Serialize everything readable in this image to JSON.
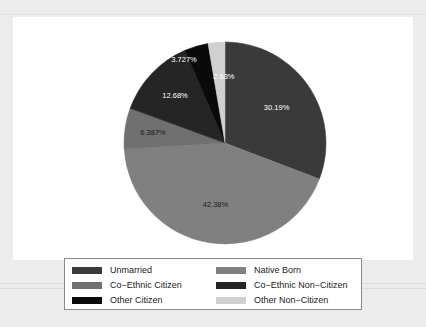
{
  "chart_data": {
    "type": "pie",
    "title": "",
    "subtitle": "",
    "xlabel": "",
    "ylabel": "",
    "legend_position": "bottom",
    "grid": false,
    "start_angle_deg": 0,
    "direction": "clockwise",
    "categories": [
      "Unmarried",
      "Native Born",
      "Co-Ethnic Citizen",
      "Co-Ethnic Non-Citizen",
      "Other Citizen",
      "Other Non-Citizen"
    ],
    "values": [
      30.19,
      42.38,
      6.387,
      12.68,
      3.727,
      2.63
    ],
    "value_labels": [
      "30.19%",
      "42.38%",
      "6.387%",
      "12.68%",
      "3.727%",
      "2.63%"
    ],
    "colors": [
      "#3a3a3a",
      "#808080",
      "#707070",
      "#252525",
      "#0a0a0a",
      "#d0d0d0"
    ],
    "label_text_colors": [
      "#ffffff",
      "#1a1a1a",
      "#1a1a1a",
      "#ffffff",
      "#ffffff",
      "#ffffff"
    ],
    "slices": [
      {
        "label": "Unmarried",
        "value": 30.19,
        "display": "30.19%",
        "color": "#3a3a3a"
      },
      {
        "label": "Native Born",
        "value": 42.38,
        "display": "42.38%",
        "color": "#808080"
      },
      {
        "label": "Co-Ethnic Citizen",
        "value": 6.387,
        "display": "6.387%",
        "color": "#707070"
      },
      {
        "label": "Co-Ethnic Non-Citizen",
        "value": 12.68,
        "display": "12.68%",
        "color": "#252525"
      },
      {
        "label": "Other Citizen",
        "value": 3.727,
        "display": "3.727%",
        "color": "#0a0a0a"
      },
      {
        "label": "Other Non-Citizen",
        "value": 2.63,
        "display": "2.63%",
        "color": "#d0d0d0"
      }
    ]
  },
  "legend": {
    "entries": [
      {
        "label": "Unmarried",
        "color": "#3a3a3a"
      },
      {
        "label": "Native Born",
        "color": "#808080"
      },
      {
        "label": "Co−Ethnic Citizen",
        "color": "#707070"
      },
      {
        "label": "Co−Ethnic Non−Citizen",
        "color": "#252525"
      },
      {
        "label": "Other Citizen",
        "color": "#0a0a0a"
      },
      {
        "label": "Other Non−Citizen",
        "color": "#d0d0d0"
      }
    ]
  },
  "labels": {
    "slice_0": "30.19%",
    "slice_1": "42.38%",
    "slice_2": "6.387%",
    "slice_3": "12.68%",
    "slice_4": "3.727%",
    "slice_5": "2.63%"
  }
}
